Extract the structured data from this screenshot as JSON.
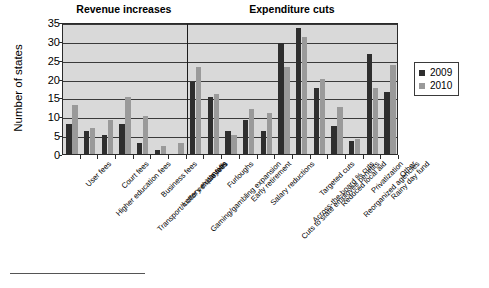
{
  "chart_data": {
    "type": "bar",
    "title": "",
    "xlabel": "",
    "ylabel": "Number of states",
    "ylim": [
      0,
      35
    ],
    "ytick_step": 5,
    "yticks": [
      "0",
      "5",
      "10",
      "15",
      "20",
      "25",
      "30",
      "35"
    ],
    "grid": true,
    "legend_position": "right",
    "sections": [
      {
        "label": "Revenue increases",
        "start_index": 0,
        "end_index": 6
      },
      {
        "label": "Expenditure cuts",
        "start_index": 7,
        "end_index": 18
      }
    ],
    "categories": [
      "User fees",
      "Higher education fees",
      "Court fees",
      "Transport/motor vehicle fees",
      "Business fees",
      "Lottery expansion",
      "Gaming/gambling expansion",
      "Layoffs",
      "Furloughs",
      "Early retirement",
      "Salary reductions",
      "Cuts to state employee benefits",
      "Across-the-board % cuts",
      "Targeted cuts",
      "Reduced local aid",
      "Reorganized agencies",
      "Privatization",
      "Rainy day fund",
      "Other"
    ],
    "series": [
      {
        "name": "2009",
        "color": "#2e2e2e",
        "values": [
          8,
          6,
          5,
          8,
          3,
          1,
          0,
          19,
          15,
          6,
          9,
          6,
          29.5,
          33.5,
          17.5,
          7.5,
          3.5,
          26.5,
          16.5
        ]
      },
      {
        "name": "2010",
        "color": "#9a9a9a",
        "values": [
          13,
          7,
          9,
          15,
          10,
          2,
          3,
          23,
          16,
          5,
          12,
          11,
          23,
          31,
          20,
          12.5,
          4,
          17.5,
          23.5
        ]
      }
    ]
  },
  "legend": {
    "items": [
      {
        "label": "2009"
      },
      {
        "label": "2010"
      }
    ]
  },
  "footer": {
    "text": ""
  }
}
